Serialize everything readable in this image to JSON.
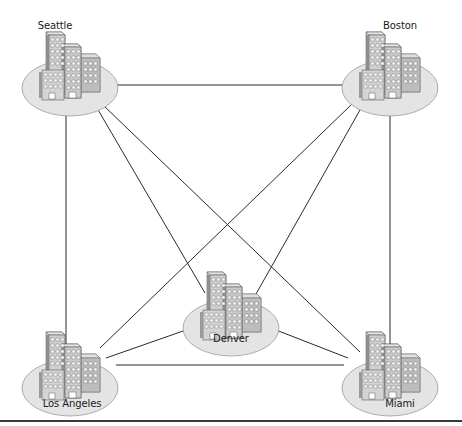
{
  "diagram": {
    "type": "full-mesh network topology",
    "colors": {
      "line": "#2b2b2b",
      "site_disc_fill": "#e4e4e4",
      "site_disc_stroke": "#9a9a9a",
      "building_light": "#d2d2d2",
      "building_dark": "#8a8a8a",
      "window": "#ffffff",
      "rule": "#3a3a3a"
    },
    "nodes": [
      {
        "id": "seattle",
        "label": "Seattle",
        "cx": 70,
        "cy": 80,
        "label_x": 55,
        "label_y": 20
      },
      {
        "id": "boston",
        "label": "Boston",
        "cx": 390,
        "cy": 80,
        "label_x": 400,
        "label_y": 20
      },
      {
        "id": "denver",
        "label": "Denver",
        "cx": 231,
        "cy": 320,
        "label_x": 231,
        "label_y": 333
      },
      {
        "id": "los_angeles",
        "label": "Los Angeles",
        "cx": 70,
        "cy": 380,
        "label_x": 72,
        "label_y": 398
      },
      {
        "id": "miami",
        "label": "Miami",
        "cx": 390,
        "cy": 380,
        "label_x": 400,
        "label_y": 398
      }
    ],
    "links": [
      {
        "from": "seattle",
        "to": "boston",
        "x1": 116,
        "y1": 85,
        "x2": 342,
        "y2": 85
      },
      {
        "from": "seattle",
        "to": "los_angeles",
        "x1": 66,
        "y1": 110,
        "x2": 66,
        "y2": 345
      },
      {
        "from": "boston",
        "to": "miami",
        "x1": 390,
        "y1": 110,
        "x2": 390,
        "y2": 345
      },
      {
        "from": "seattle",
        "to": "denver",
        "x1": 97,
        "y1": 108,
        "x2": 205,
        "y2": 293
      },
      {
        "from": "seattle",
        "to": "miami",
        "x1": 103,
        "y1": 105,
        "x2": 360,
        "y2": 352
      },
      {
        "from": "boston",
        "to": "los_angeles",
        "x1": 352,
        "y1": 104,
        "x2": 100,
        "y2": 348
      },
      {
        "from": "boston",
        "to": "denver",
        "x1": 360,
        "y1": 110,
        "x2": 256,
        "y2": 294
      },
      {
        "from": "los_angeles",
        "to": "denver",
        "x1": 106,
        "y1": 358,
        "x2": 186,
        "y2": 330
      },
      {
        "from": "denver",
        "to": "miami",
        "x1": 276,
        "y1": 330,
        "x2": 348,
        "y2": 358
      },
      {
        "from": "los_angeles",
        "to": "miami",
        "x1": 116,
        "y1": 365,
        "x2": 344,
        "y2": 365
      }
    ]
  }
}
